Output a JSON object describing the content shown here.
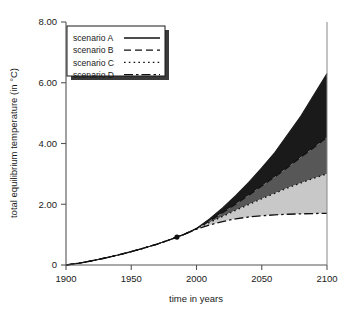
{
  "chart_data": {
    "type": "area",
    "title": "",
    "xlabel": "time in years",
    "ylabel": "total equilibrium temperature (in °C)",
    "xlim": [
      1900,
      2100
    ],
    "ylim": [
      0,
      8
    ],
    "grid": false,
    "legend_position": "top-left",
    "x_ticks": [
      1900,
      1950,
      2000,
      2050,
      2100
    ],
    "x_tick_labels": [
      "1900",
      "1950",
      "2000",
      "2050",
      "2100"
    ],
    "y_ticks": [
      0,
      2,
      4,
      6,
      8
    ],
    "y_tick_labels": [
      "0",
      "2.00",
      "4.00",
      "6.00",
      "8.00"
    ],
    "x": [
      1900,
      1910,
      1920,
      1930,
      1940,
      1950,
      1960,
      1970,
      1980,
      1985,
      1990,
      2000,
      2010,
      2020,
      2030,
      2040,
      2050,
      2060,
      2070,
      2080,
      2090,
      2100
    ],
    "series": [
      {
        "name": "scenario A",
        "linestyle": "solid",
        "band_fill": "#1a1a1a",
        "end_value": 6.3,
        "values": [
          0.0,
          0.06,
          0.14,
          0.23,
          0.33,
          0.44,
          0.56,
          0.69,
          0.84,
          0.92,
          1.0,
          1.2,
          1.52,
          1.88,
          2.28,
          2.72,
          3.2,
          3.7,
          4.3,
          4.9,
          5.6,
          6.3
        ]
      },
      {
        "name": "scenario B",
        "linestyle": "dashed",
        "band_fill": "#575757",
        "end_value": 4.2,
        "values": [
          0.0,
          0.06,
          0.14,
          0.23,
          0.33,
          0.44,
          0.56,
          0.69,
          0.84,
          0.92,
          1.0,
          1.2,
          1.45,
          1.72,
          2.0,
          2.3,
          2.6,
          2.9,
          3.22,
          3.55,
          3.87,
          4.2
        ]
      },
      {
        "name": "scenario C",
        "linestyle": "dotted",
        "band_fill": "#c8c8c8",
        "end_value": 3.0,
        "values": [
          0.0,
          0.06,
          0.14,
          0.23,
          0.33,
          0.44,
          0.56,
          0.69,
          0.84,
          0.92,
          1.0,
          1.2,
          1.4,
          1.6,
          1.8,
          1.99,
          2.18,
          2.36,
          2.54,
          2.7,
          2.86,
          3.0
        ]
      },
      {
        "name": "scenario D",
        "linestyle": "dashdot",
        "band_fill": "#ffffff",
        "end_value": 1.7,
        "values": [
          0.0,
          0.06,
          0.14,
          0.23,
          0.33,
          0.44,
          0.56,
          0.69,
          0.84,
          0.92,
          1.0,
          1.18,
          1.32,
          1.43,
          1.52,
          1.58,
          1.62,
          1.65,
          1.67,
          1.685,
          1.695,
          1.7
        ]
      }
    ],
    "annotations": [
      {
        "name": "present-day-marker",
        "x": 1985,
        "y": 0.92,
        "marker": "filled-circle"
      }
    ]
  },
  "legend": {
    "entries": [
      {
        "label": "scenario A",
        "style": "solid"
      },
      {
        "label": "scenario B",
        "style": "dashed"
      },
      {
        "label": "scenario C",
        "style": "dotted"
      },
      {
        "label": "scenario D",
        "style": "dashdot"
      }
    ]
  },
  "axes": {
    "x_label": "time in years",
    "y_label": "total equilibrium temperature (in °C)",
    "x_tick_labels": [
      "1900",
      "1950",
      "2000",
      "2050",
      "2100"
    ],
    "y_tick_labels": [
      "0",
      "2.00",
      "4.00",
      "6.00",
      "8.00"
    ]
  }
}
